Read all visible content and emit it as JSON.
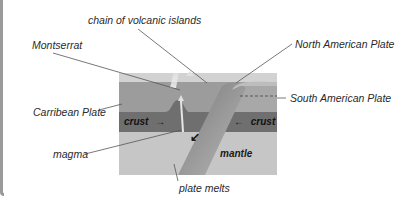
{
  "diagram": {
    "labels": {
      "chain_of_volcanic_islands": "chain of volcanic islands",
      "montserrat": "Montserrat",
      "north_american_plate": "North American Plate",
      "south_american_plate": "South American Plate",
      "carribean_plate": "Carribean Plate",
      "magma": "magma",
      "plate_melts": "plate melts"
    },
    "inner_labels": {
      "crust_left": "crust",
      "crust_right": "crust",
      "mantle": "mantle"
    },
    "arrows": {
      "crust_left": "→",
      "crust_right": "←",
      "slab": "↙"
    },
    "colors": {
      "ocean": "#d2d2d2",
      "upper_plate": "#9c9c9c",
      "crust": "#6f6f6f",
      "mantle": "#c6c6c6",
      "slab": "#8a8a8a",
      "leader_line": "#555555",
      "frame_edge": "#9a9a9a"
    }
  }
}
